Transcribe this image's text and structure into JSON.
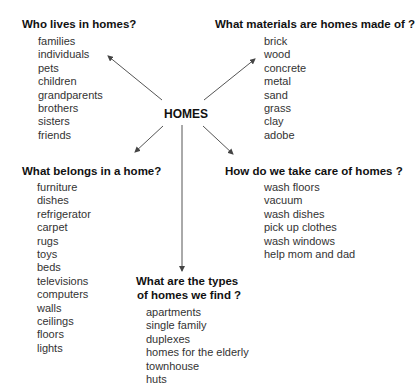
{
  "center": {
    "label": "HOMES"
  },
  "nodes": {
    "who": {
      "heading": "Who lives in homes?",
      "items": [
        "families",
        "individuals",
        "pets",
        "children",
        "grandparents",
        "brothers",
        "sisters",
        "friends"
      ]
    },
    "materials": {
      "heading": "What materials are homes made of ?",
      "items": [
        "brick",
        "wood",
        "concrete",
        "metal",
        "sand",
        "grass",
        "clay",
        "adobe"
      ]
    },
    "belongs": {
      "heading": "What belongs in a home?",
      "items": [
        "furniture",
        "dishes",
        "refrigerator",
        "carpet",
        "rugs",
        "toys",
        "beds",
        "televisions",
        "computers",
        "walls",
        "ceilings",
        "floors",
        "lights"
      ]
    },
    "care": {
      "heading": "How do we take care of homes ?",
      "items": [
        "wash floors",
        "vacuum",
        "wash dishes",
        "pick up clothes",
        "wash windows",
        "help mom and dad"
      ]
    },
    "types": {
      "heading_line1": "What are the types",
      "heading_line2": "of homes we find ?",
      "items": [
        "apartments",
        "single family",
        "duplexes",
        "homes for the elderly",
        "townhouse",
        "huts"
      ]
    }
  },
  "colors": {
    "text": "#333333",
    "heading": "#111111",
    "arrow": "#555555",
    "background": "#ffffff"
  }
}
